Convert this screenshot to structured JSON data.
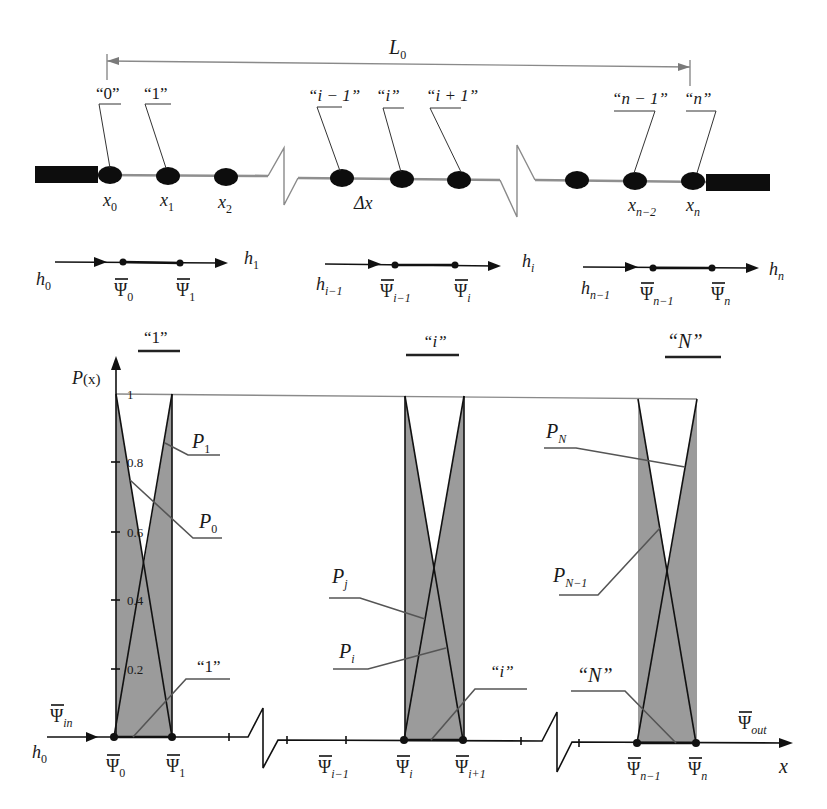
{
  "diagram": {
    "length": {
      "main": "L",
      "sub": "0"
    },
    "node_tags": [
      "“0”",
      "“1”",
      "“i − 1”",
      "“i”",
      "“i + 1”",
      "“n − 1”",
      "“n”"
    ],
    "coords": [
      {
        "main": "x",
        "sub": "0"
      },
      {
        "main": "x",
        "sub": "1"
      },
      {
        "main": "x",
        "sub": "2"
      },
      {
        "main": "Δx",
        "sub": ""
      },
      {
        "main": "x",
        "sub": "n−2"
      },
      {
        "main": "x",
        "sub": "n"
      }
    ],
    "flow": [
      {
        "h_in": {
          "main": "h",
          "sub": "0"
        },
        "h_out": {
          "main": "h",
          "sub": "1"
        },
        "psi_a": {
          "main": "Ψ",
          "sub": "0"
        },
        "psi_b": {
          "main": "Ψ",
          "sub": "1"
        }
      },
      {
        "h_in": {
          "main": "h",
          "sub": "i−1"
        },
        "h_out": {
          "main": "h",
          "sub": "i"
        },
        "psi_a": {
          "main": "Ψ",
          "sub": "i−1"
        },
        "psi_b": {
          "main": "Ψ",
          "sub": "i"
        }
      },
      {
        "h_in": {
          "main": "h",
          "sub": "n−1"
        },
        "h_out": {
          "main": "h",
          "sub": "n"
        },
        "psi_a": {
          "main": "Ψ",
          "sub": "n−1"
        },
        "psi_b": {
          "main": "Ψ",
          "sub": "n"
        }
      }
    ],
    "elements": [
      "“1”",
      "“i”",
      "“N”"
    ]
  },
  "plot": {
    "y_label": {
      "main": "P",
      "paren": "(x)"
    },
    "y_ticks": [
      "1",
      "0.8",
      "0.6",
      "0.4",
      "0.2"
    ],
    "x_label": "x",
    "inlet": {
      "psi": {
        "main": "Ψ",
        "sub": "in"
      },
      "h": {
        "main": "h",
        "sub": "0"
      }
    },
    "outlet": {
      "psi": {
        "main": "Ψ",
        "sub": "out"
      }
    },
    "nodes": [
      {
        "main": "Ψ",
        "sub": "0"
      },
      {
        "main": "Ψ",
        "sub": "1"
      },
      {
        "main": "Ψ",
        "sub": "i−1"
      },
      {
        "main": "Ψ",
        "sub": "i"
      },
      {
        "main": "Ψ",
        "sub": "i+1"
      },
      {
        "main": "Ψ",
        "sub": "n−1"
      },
      {
        "main": "Ψ",
        "sub": "n"
      }
    ],
    "curves": [
      {
        "main": "P",
        "sub": "1"
      },
      {
        "main": "P",
        "sub": "0"
      },
      {
        "main": "P",
        "sub": "j"
      },
      {
        "main": "P",
        "sub": "i"
      },
      {
        "main": "P",
        "sub": "N"
      },
      {
        "main": "P",
        "sub": "N−1"
      }
    ],
    "element_tags": [
      "“1”",
      "“i”",
      "“N”"
    ],
    "colors": {
      "shade": "#9b9b9b",
      "line": "#111111",
      "rod": "#8f8f8f"
    }
  }
}
